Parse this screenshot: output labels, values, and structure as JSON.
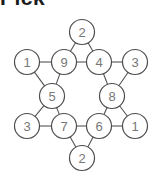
{
  "header": {
    "text": "Pick"
  },
  "figure": {
    "background_color": "#ffffff",
    "node_fill": "#ffffff",
    "node_stroke": "#4d4d4d",
    "label_color": "#777777",
    "edge_color": "#555555",
    "node_radius": 12.5,
    "nodes": [
      {
        "id": "top",
        "label": "2",
        "x": 82,
        "y": 32
      },
      {
        "id": "row2-left",
        "label": "1",
        "x": 27,
        "y": 62
      },
      {
        "id": "row2-midleft",
        "label": "9",
        "x": 64,
        "y": 62
      },
      {
        "id": "row2-midright",
        "label": "4",
        "x": 99,
        "y": 62
      },
      {
        "id": "row2-right",
        "label": "3",
        "x": 135,
        "y": 62
      },
      {
        "id": "mid-left",
        "label": "5",
        "x": 52,
        "y": 96
      },
      {
        "id": "mid-right",
        "label": "8",
        "x": 112,
        "y": 96
      },
      {
        "id": "row4-left",
        "label": "3",
        "x": 27,
        "y": 126
      },
      {
        "id": "row4-midleft",
        "label": "7",
        "x": 64,
        "y": 126
      },
      {
        "id": "row4-midright",
        "label": "6",
        "x": 99,
        "y": 126
      },
      {
        "id": "row4-right",
        "label": "1",
        "x": 135,
        "y": 126
      },
      {
        "id": "bottom",
        "label": "2",
        "x": 82,
        "y": 158
      }
    ],
    "edges": [
      {
        "from": "top",
        "to": "row2-midleft"
      },
      {
        "from": "top",
        "to": "row2-midright"
      },
      {
        "from": "row2-left",
        "to": "row2-midleft"
      },
      {
        "from": "row2-midleft",
        "to": "row2-midright"
      },
      {
        "from": "row2-midright",
        "to": "row2-right"
      },
      {
        "from": "row2-left",
        "to": "mid-left"
      },
      {
        "from": "mid-left",
        "to": "row2-midleft"
      },
      {
        "from": "row2-right",
        "to": "mid-right"
      },
      {
        "from": "mid-right",
        "to": "row2-midright"
      },
      {
        "from": "mid-left",
        "to": "row4-left"
      },
      {
        "from": "mid-left",
        "to": "row4-midleft"
      },
      {
        "from": "mid-right",
        "to": "row4-midright"
      },
      {
        "from": "mid-right",
        "to": "row4-right"
      },
      {
        "from": "row4-left",
        "to": "row4-midleft"
      },
      {
        "from": "row4-midleft",
        "to": "row4-midright"
      },
      {
        "from": "row4-midright",
        "to": "row4-right"
      },
      {
        "from": "row4-midleft",
        "to": "bottom"
      },
      {
        "from": "row4-midright",
        "to": "bottom"
      }
    ]
  }
}
